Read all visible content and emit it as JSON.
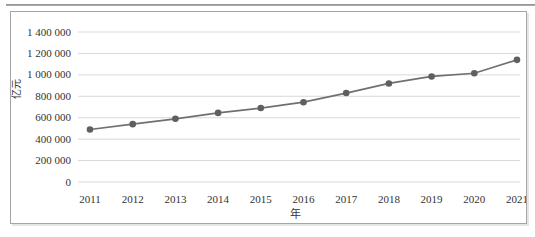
{
  "figure": {
    "background_color": "#ffffff",
    "top_rule_color": "#8f8f8f",
    "frame_border_color": "#a5a5a5"
  },
  "chart_data": {
    "type": "line",
    "title": "",
    "xlabel": "年",
    "ylabel": "亿元",
    "categories": [
      "2011",
      "2012",
      "2013",
      "2014",
      "2015",
      "2016",
      "2017",
      "2018",
      "2019",
      "2020",
      "2021"
    ],
    "series": [
      {
        "name": "",
        "values": [
          490000,
          540000,
          590000,
          645000,
          690000,
          745000,
          830000,
          920000,
          985000,
          1015000,
          1140000
        ]
      }
    ],
    "ylim": [
      0,
      1400000
    ],
    "ytick_step": 200000,
    "ytick_values": [
      0,
      200000,
      400000,
      600000,
      800000,
      1000000,
      1200000,
      1400000
    ],
    "ytick_labels": [
      "0",
      "200 000",
      "400 000",
      "600 000",
      "800 000",
      "1 000 000",
      "1 200 000",
      "1 400 000"
    ],
    "grid": true,
    "legend_position": "none",
    "line_color": "#707070",
    "marker_color": "#5f5f5f",
    "gridline_color": "#d9d9d9",
    "text_color": "#333333"
  }
}
